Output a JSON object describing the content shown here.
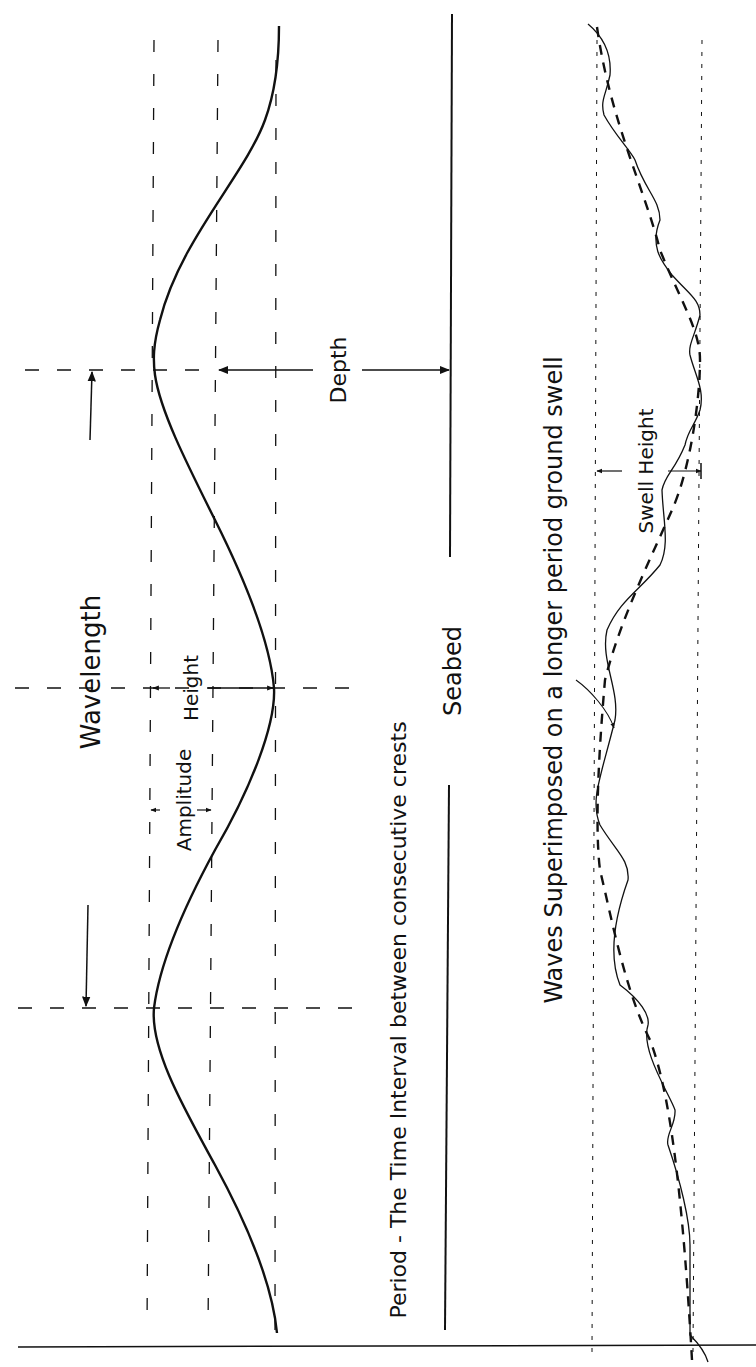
{
  "diagram": {
    "orientation": "rotated-90-ccw",
    "ink_color": "#111111",
    "background": "#ffffff",
    "wave_anatomy": {
      "labels": {
        "wavelength": "Wavelength",
        "amplitude": "Amplitude",
        "height": "Height",
        "depth": "Depth",
        "seabed": "Seabed",
        "period": "Period - The Time Interval between consecutive crests"
      }
    },
    "swell": {
      "labels": {
        "caption": "Waves Superimposed on a longer period ground swell",
        "swell_height": "Swell Height"
      }
    }
  }
}
